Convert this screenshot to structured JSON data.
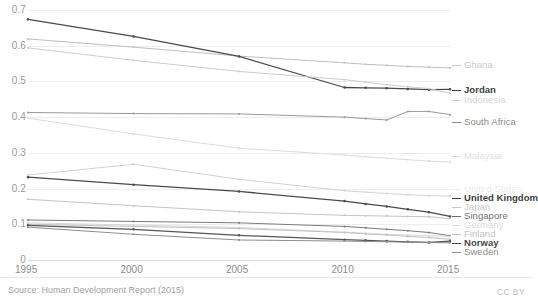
{
  "footer": {
    "source": "Source: Human Development Report (2015)",
    "license": "CC BY"
  },
  "chart_data": {
    "type": "line",
    "title": "",
    "subtitle": "",
    "xlabel": "",
    "ylabel": "",
    "x": [
      1995,
      2000,
      2005,
      2010,
      2011,
      2012,
      2013,
      2014,
      2015
    ],
    "xticks": [
      "1995",
      "2000",
      "2005",
      "2010",
      "2015"
    ],
    "xlim": [
      1995,
      2015
    ],
    "yticks": [
      "0",
      "0.1",
      "0.2",
      "0.3",
      "0.4",
      "0.5",
      "0.6",
      "0.7"
    ],
    "ylim": [
      0,
      0.7
    ],
    "grid": true,
    "legend_position": "right",
    "marker": "dot",
    "series": [
      {
        "name": "Ghana",
        "color": "#bfbfbf",
        "emphasis": "faint",
        "values": [
          0.619,
          0.596,
          0.571,
          0.552,
          0.548,
          0.545,
          0.542,
          0.54,
          0.538
        ]
      },
      {
        "name": "Jordan",
        "color": "#4a4a4a",
        "emphasis": "bold",
        "values": [
          0.674,
          0.626,
          0.57,
          0.483,
          0.482,
          0.481,
          0.479,
          0.477,
          0.478
        ]
      },
      {
        "name": "Indonesia",
        "color": "#cccccc",
        "emphasis": "faint",
        "values": [
          0.594,
          0.559,
          0.528,
          0.505,
          0.498,
          0.491,
          0.485,
          0.48,
          0.467
        ]
      },
      {
        "name": "South Africa",
        "color": "#9a9a9a",
        "emphasis": "normal",
        "values": [
          0.413,
          0.41,
          0.409,
          0.4,
          0.396,
          0.392,
          0.416,
          0.416,
          0.407
        ]
      },
      {
        "name": "Malaysia",
        "color": "#dcdcdc",
        "emphasis": "faint",
        "values": [
          0.397,
          0.353,
          0.313,
          0.294,
          0.289,
          0.285,
          0.281,
          0.277,
          0.274
        ]
      },
      {
        "name": "United States",
        "color": "#d2d2d2",
        "emphasis": "faint",
        "values": [
          0.238,
          0.268,
          0.226,
          0.194,
          0.19,
          0.186,
          0.183,
          0.18,
          0.179
        ]
      },
      {
        "name": "United Kingdom",
        "color": "#4a4a4a",
        "emphasis": "bold",
        "values": [
          0.232,
          0.211,
          0.192,
          0.165,
          0.157,
          0.15,
          0.142,
          0.134,
          0.122
        ]
      },
      {
        "name": "Japan",
        "color": "#c4c4c4",
        "emphasis": "faint",
        "values": [
          0.17,
          0.152,
          0.135,
          0.125,
          0.124,
          0.123,
          0.122,
          0.121,
          0.116
        ]
      },
      {
        "name": "Singapore",
        "color": "#7a7a7a",
        "emphasis": "normal",
        "values": [
          0.112,
          0.108,
          0.104,
          0.094,
          0.09,
          0.086,
          0.082,
          0.077,
          0.068
        ]
      },
      {
        "name": "Germany",
        "color": "#d8d8d8",
        "emphasis": "faint",
        "values": [
          0.104,
          0.098,
          0.091,
          0.078,
          0.075,
          0.072,
          0.07,
          0.068,
          0.066
        ]
      },
      {
        "name": "Finland",
        "color": "#c0c0c0",
        "emphasis": "faint",
        "values": [
          0.1,
          0.094,
          0.088,
          0.077,
          0.073,
          0.07,
          0.066,
          0.063,
          0.058
        ]
      },
      {
        "name": "Norway",
        "color": "#555555",
        "emphasis": "bold",
        "values": [
          0.097,
          0.086,
          0.069,
          0.057,
          0.055,
          0.053,
          0.051,
          0.049,
          0.053
        ]
      },
      {
        "name": "Sweden",
        "color": "#8e8e8e",
        "emphasis": "normal",
        "values": [
          0.092,
          0.072,
          0.056,
          0.053,
          0.052,
          0.051,
          0.05,
          0.049,
          0.048
        ]
      }
    ],
    "legend_entries": [
      {
        "name": "Ghana",
        "y": 65,
        "color": "#c9c9c9",
        "weight": "normal"
      },
      {
        "name": "Jordan",
        "y": 90,
        "color": "#3d3d3d",
        "weight": "bold"
      },
      {
        "name": "Indonesia",
        "y": 100,
        "color": "#d4d4d4",
        "weight": "normal"
      },
      {
        "name": "South Africa",
        "y": 122,
        "color": "#8a8a8a",
        "weight": "normal"
      },
      {
        "name": "Malaysia",
        "y": 156,
        "color": "#e0e0e0",
        "weight": "normal"
      },
      {
        "name": "United States",
        "y": 189,
        "color": "#ececec",
        "weight": "normal"
      },
      {
        "name": "United Kingdom",
        "y": 198,
        "color": "#3d3d3d",
        "weight": "bold"
      },
      {
        "name": "Japan",
        "y": 207,
        "color": "#c7c7c7",
        "weight": "normal"
      },
      {
        "name": "Singapore",
        "y": 216,
        "color": "#6f6f6f",
        "weight": "normal"
      },
      {
        "name": "Germany",
        "y": 225,
        "color": "#dadada",
        "weight": "normal"
      },
      {
        "name": "Finland",
        "y": 234,
        "color": "#c0c0c0",
        "weight": "normal"
      },
      {
        "name": "Norway",
        "y": 243,
        "color": "#4a4a4a",
        "weight": "bold"
      },
      {
        "name": "Sweden",
        "y": 252,
        "color": "#8e8e8e",
        "weight": "normal"
      }
    ]
  }
}
